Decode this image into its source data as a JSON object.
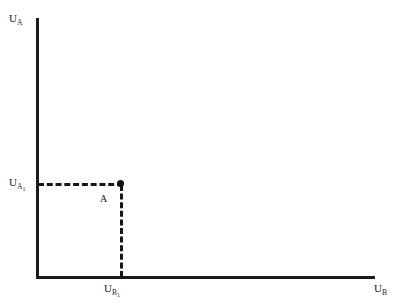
{
  "chart_data": {
    "type": "scatter",
    "title": "",
    "subtitle": "",
    "xlabel": "U_B",
    "ylabel": "U_A",
    "grid": false,
    "legend": null,
    "xlim": [
      0,
      1
    ],
    "ylim": [
      0,
      1
    ],
    "axis_labels": {
      "y_axis_top": "U",
      "y_axis_top_sub": "A",
      "x_axis_right": "U",
      "x_axis_right_sub": "B"
    },
    "tick_labels": {
      "y_tick": "U",
      "y_tick_sub": "A",
      "y_tick_sub_sub": "1",
      "x_tick": "U",
      "x_tick_sub": "B",
      "x_tick_sub_sub": "1"
    },
    "points": [
      {
        "name": "A",
        "label": "A",
        "x_value_label": "U_B1",
        "x_pixel_fraction": 0.25,
        "y_value_label": "U_A1",
        "y_pixel_fraction": 0.36,
        "marker": "filled-circle"
      }
    ],
    "guide_lines": [
      {
        "name": "horizontal-dashed-guide",
        "orientation": "horizontal",
        "style": "dashed",
        "from": "y-axis",
        "to": "point A"
      },
      {
        "name": "vertical-dashed-guide",
        "orientation": "vertical",
        "style": "dashed",
        "from": "point A",
        "to": "x-axis"
      }
    ],
    "colors": {
      "background": "#ffffff",
      "axis": "#1a1a1a",
      "dashed": "#161616",
      "marker": "#111111",
      "text": "#1a1a1a"
    }
  }
}
